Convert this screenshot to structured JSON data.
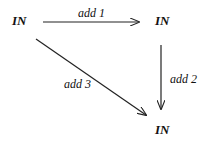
{
  "diagram": {
    "type": "commutative-diagram",
    "nodes": [
      {
        "id": "top-left",
        "label": "IN"
      },
      {
        "id": "top-right",
        "label": "IN"
      },
      {
        "id": "bottom-right",
        "label": "IN"
      }
    ],
    "edges": [
      {
        "from": "top-left",
        "to": "top-right",
        "label": "add 1"
      },
      {
        "from": "top-right",
        "to": "bottom-right",
        "label": "add 2"
      },
      {
        "from": "top-left",
        "to": "bottom-right",
        "label": "add 3"
      }
    ]
  }
}
